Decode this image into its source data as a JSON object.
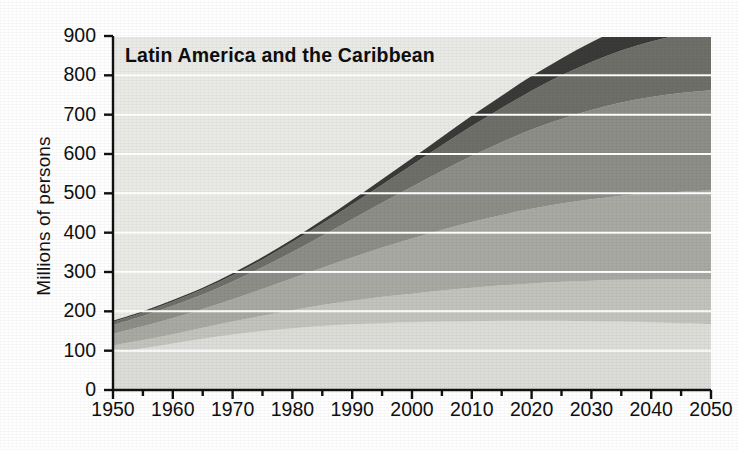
{
  "figure": {
    "title": "Latin America and the Caribbean",
    "ylabel": "Millions of persons"
  },
  "axis": {
    "y_ticks": [
      "900",
      "800",
      "700",
      "600",
      "500",
      "400",
      "300",
      "200",
      "100",
      "0"
    ],
    "x_ticks": [
      "1950",
      "1960",
      "1970",
      "1980",
      "1990",
      "2000",
      "2010",
      "2020",
      "2030",
      "2040",
      "2050"
    ]
  },
  "colors": {
    "background": "#ededea",
    "plot_background": "#e9e9e6",
    "gridline": "#ffffff",
    "axis": "#111111",
    "text": "#101010",
    "band_1": "#dcdcd8",
    "band_2": "#c3c3bd",
    "band_3": "#a9a9a3",
    "band_4": "#8e8e88",
    "band_5": "#6f6f6a",
    "band_6": "#3a3a38"
  },
  "chart_data": {
    "type": "area",
    "title": "Latin America and the Caribbean",
    "xlabel": "",
    "ylabel": "Millions of persons",
    "xlim": [
      1950,
      2050
    ],
    "ylim": [
      0,
      900
    ],
    "grid": true,
    "legend": "none",
    "stacked": true,
    "x": [
      1950,
      1955,
      1960,
      1965,
      1970,
      1975,
      1980,
      1985,
      1990,
      1995,
      2000,
      2005,
      2010,
      2015,
      2020,
      2025,
      2030,
      2035,
      2040,
      2045,
      2050
    ],
    "series": [
      {
        "name": "band-1-lightest",
        "color": "#dcdcd8",
        "values": [
          95,
          106,
          118,
          130,
          141,
          150,
          157,
          163,
          167,
          170,
          172,
          174,
          175,
          176,
          176,
          176,
          175,
          174,
          172,
          170,
          168
        ]
      },
      {
        "name": "band-2",
        "color": "#c3c3bd",
        "values": [
          18,
          21,
          24,
          28,
          33,
          39,
          46,
          53,
          60,
          67,
          73,
          79,
          85,
          90,
          95,
          99,
          103,
          106,
          109,
          111,
          113
        ]
      },
      {
        "name": "band-3",
        "color": "#a9a9a3",
        "values": [
          30,
          35,
          41,
          48,
          57,
          68,
          81,
          95,
          110,
          125,
          140,
          154,
          167,
          179,
          190,
          199,
          207,
          214,
          219,
          223,
          226
        ]
      },
      {
        "name": "band-4",
        "color": "#8e8e88",
        "values": [
          22,
          26,
          31,
          37,
          45,
          55,
          67,
          81,
          97,
          114,
          132,
          150,
          168,
          185,
          201,
          215,
          227,
          237,
          245,
          251,
          255
        ]
      },
      {
        "name": "band-5",
        "color": "#6f6f6a",
        "values": [
          8,
          9,
          11,
          13,
          16,
          20,
          25,
          31,
          38,
          46,
          55,
          65,
          76,
          87,
          99,
          111,
          122,
          132,
          141,
          148,
          154
        ]
      },
      {
        "name": "band-6-darkest",
        "color": "#3a3a38",
        "values": [
          3,
          3,
          4,
          4,
          5,
          6,
          7,
          9,
          11,
          14,
          17,
          21,
          26,
          31,
          37,
          43,
          50,
          57,
          64,
          70,
          76
        ]
      }
    ],
    "total": [
      176,
      200,
      229,
      260,
      297,
      338,
      383,
      432,
      483,
      536,
      589,
      643,
      697,
      748,
      798,
      843,
      884,
      920,
      950,
      973,
      992
    ]
  }
}
